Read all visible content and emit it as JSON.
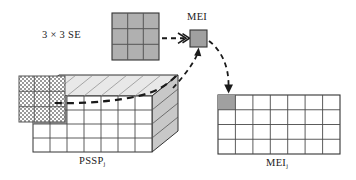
{
  "figure": {
    "background_color": "#ffffff",
    "width": 356,
    "height": 180
  },
  "colors": {
    "stroke": "#1a1a1a",
    "cell_fill_gray": "#a0a0a0",
    "se_fill_gray": "#b0b0b0",
    "box_front_fill": "#ffffff",
    "box_top_fill": "#e8e8e8",
    "box_side_fill": "#c8c8c8",
    "checker_light": "#ffffff",
    "checker_dark": "#9a9a9a",
    "dash_color": "#1a1a1a"
  },
  "labels": {
    "structuring_element": "3 × 3 SE",
    "mei_pixel": "MEI",
    "pssp_plane": "PSSP",
    "pssp_plane_sub": "j",
    "mei_plane": "MEI",
    "mei_plane_sub": "j"
  },
  "structuring_element": {
    "name": "3 × 3 SE",
    "rows": 3,
    "cols": 3,
    "cell_size_px": 15.7,
    "origin": {
      "x": 112,
      "y": 13
    },
    "fill": "#b0b0b0",
    "all_cells_filled": true
  },
  "mei_pixel": {
    "name": "MEI",
    "origin": {
      "x": 190,
      "y": 30
    },
    "size_px": 17,
    "fill": "#a0a0a0"
  },
  "pssp_box": {
    "name": "PSSP",
    "front_face": {
      "rows": 4,
      "cols": 7,
      "origin": {
        "x": 33,
        "y": 96
      },
      "width": 119,
      "height": 56,
      "fill": "#ffffff"
    },
    "top_face_fill": "#e8e8e8",
    "side_face_fill": "#c8c8c8",
    "depth_offset": {
      "dx": 26,
      "dy": -21
    },
    "shaded_cells": [
      {
        "row": 0,
        "col": 0
      },
      {
        "row": 0,
        "col": 1
      },
      {
        "row": 1,
        "col": 0
      },
      {
        "row": 1,
        "col": 1
      }
    ],
    "checker_overlay": {
      "rows": 3,
      "cols": 3,
      "origin": {
        "x": 19,
        "y": 76
      },
      "cell_size_px": 15.3,
      "pattern": "checkerboard"
    }
  },
  "mei_plane": {
    "name": "MEI",
    "rows": 4,
    "cols": 7,
    "origin": {
      "x": 218,
      "y": 95
    },
    "width": 122,
    "height": 59,
    "filled_cell": {
      "row": 0,
      "col": 0,
      "fill": "#a0a0a0"
    }
  },
  "arrows": [
    {
      "name": "se-to-mei-arrow",
      "style": "dashed-straight",
      "from": {
        "x": 162,
        "y": 38
      },
      "to": {
        "x": 189,
        "y": 38
      },
      "head": "double-chevron"
    },
    {
      "name": "pssp-to-mei-arrow",
      "style": "dashed-curved",
      "from": {
        "x": 175,
        "y": 86
      },
      "to": {
        "x": 198,
        "y": 50
      },
      "head": "single-arrow"
    },
    {
      "name": "mei-to-meiplane-arrow",
      "style": "dashed-curved",
      "from": {
        "x": 209,
        "y": 42
      },
      "to": {
        "x": 228,
        "y": 92
      },
      "head": "single-arrow"
    },
    {
      "name": "scan-path-curve",
      "style": "dashed-curved-thick",
      "from": {
        "x": 55,
        "y": 103
      },
      "to": {
        "x": 177,
        "y": 75
      },
      "head": "none"
    }
  ]
}
